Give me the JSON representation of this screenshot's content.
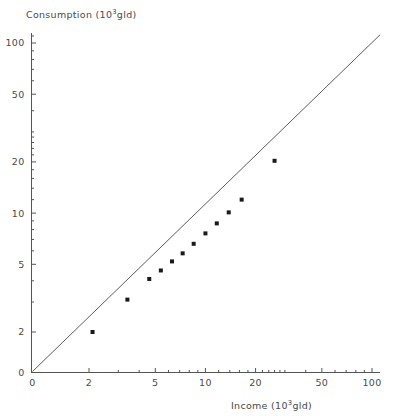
{
  "chart_data": {
    "type": "scatter",
    "title": "",
    "xlabel": "Income (10³gld)",
    "ylabel": "Consumption (10³gld)",
    "xscale": "log",
    "yscale": "log",
    "xlim": [
      1.55,
      115
    ],
    "ylim": [
      1.55,
      115
    ],
    "xticks": [
      2,
      5,
      10,
      20,
      50,
      100
    ],
    "xticklabels": [
      "2",
      "5",
      "10",
      "20",
      "50",
      "100"
    ],
    "yticks": [
      2,
      5,
      10,
      20,
      50,
      100
    ],
    "yticklabels": [
      "2",
      "5",
      "10",
      "20",
      "50",
      "100"
    ],
    "origin_label": "0",
    "grid": false,
    "legend": null,
    "series": [
      {
        "name": "Consumption vs Income",
        "marker": "square",
        "marker_color": "#1a1a1a",
        "x": [
          2.1,
          3.4,
          4.6,
          5.4,
          6.3,
          7.3,
          8.5,
          10.0,
          11.7,
          13.8,
          16.5,
          26.0
        ],
        "y": [
          2.0,
          3.1,
          4.1,
          4.6,
          5.2,
          5.8,
          6.6,
          7.6,
          8.7,
          10.1,
          12.0,
          20.3
        ]
      }
    ],
    "reference_line": {
      "name": "y = x identity line",
      "color": "#4a4a4a",
      "x": [
        1.62,
        112
      ],
      "y": [
        1.62,
        112
      ]
    },
    "annotations": []
  },
  "axes": {
    "y_title": "Consumption (10",
    "y_title_sup": "3",
    "y_title_tail": "gld)",
    "x_title": "Income (10",
    "x_title_sup": "3",
    "x_title_tail": "gld)",
    "origin_x_label": "0",
    "origin_y_label": "0"
  },
  "caption": ""
}
